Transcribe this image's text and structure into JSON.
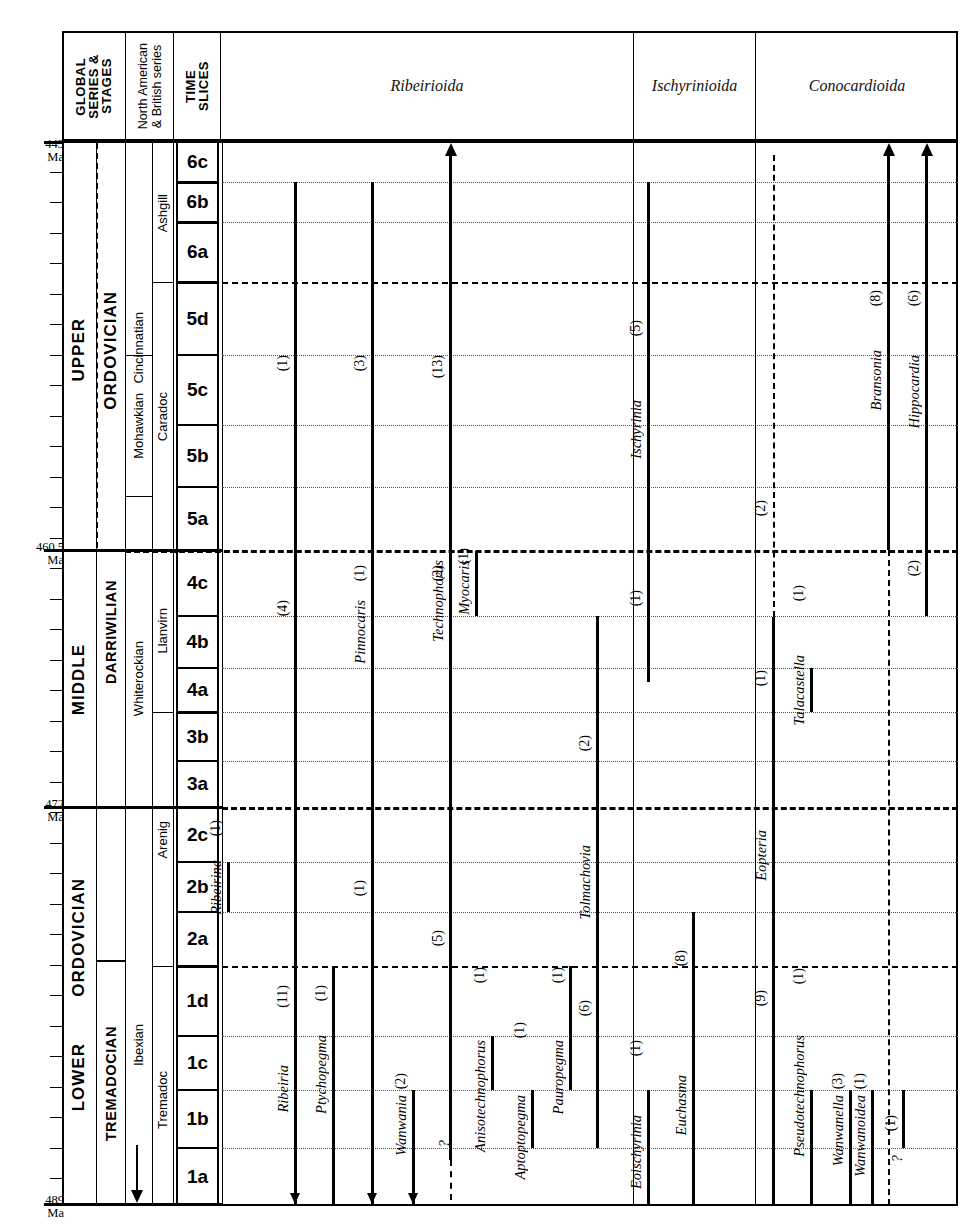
{
  "figure": {
    "type": "range-chart"
  },
  "header": {
    "col_global": "GLOBAL\nSERIES &\nSTAGES",
    "col_global_lines": [
      "GLOBAL",
      "SERIES &",
      "STAGES"
    ],
    "col_namerican": "North American\n& British series",
    "col_namerican_lines": [
      "North American",
      "& British series"
    ],
    "col_timeslices": "TIME\nSLICES",
    "col_timeslices_lines": [
      "TIME",
      "SLICES"
    ],
    "superfamilies": [
      {
        "label": "Ribeirioida"
      },
      {
        "label": "Ischyrinioida"
      },
      {
        "label": "Conocardioida"
      }
    ]
  },
  "age_labels": [
    {
      "value": "443",
      "unit": "Ma"
    },
    {
      "value": "460.5",
      "unit": "Ma"
    },
    {
      "value": "472",
      "unit": "Ma"
    },
    {
      "value": "489",
      "unit": "Ma"
    }
  ],
  "global_series": [
    {
      "label": "UPPER"
    },
    {
      "label": "MIDDLE"
    },
    {
      "label": "LOWER"
    }
  ],
  "global_stages": [
    {
      "label": "ORDOVICIAN"
    },
    {
      "label": "ORDOVICIAN"
    },
    {
      "label": "ORDOVICIAN"
    },
    {
      "label": "DARRIWILIAN"
    },
    {
      "label": "TREMADOCIAN"
    }
  ],
  "north_american_series": [
    {
      "label": "Cincinnatian"
    },
    {
      "label": "Mohawkian"
    },
    {
      "label": "Whiterockian"
    },
    {
      "label": "Ibexian"
    }
  ],
  "british_series": [
    {
      "label": "Ashgill"
    },
    {
      "label": "Caradoc"
    },
    {
      "label": "Llanvirn"
    },
    {
      "label": "Arenig"
    },
    {
      "label": "Tremadoc"
    }
  ],
  "time_slices": [
    {
      "label": "6c"
    },
    {
      "label": "6b"
    },
    {
      "label": "6a"
    },
    {
      "label": "5d"
    },
    {
      "label": "5c"
    },
    {
      "label": "5b"
    },
    {
      "label": "5a"
    },
    {
      "label": "4c"
    },
    {
      "label": "4b"
    },
    {
      "label": "4a"
    },
    {
      "label": "3b"
    },
    {
      "label": "3a"
    },
    {
      "label": "2c"
    },
    {
      "label": "2b"
    },
    {
      "label": "2a"
    },
    {
      "label": "1d"
    },
    {
      "label": "1c"
    },
    {
      "label": "1b"
    },
    {
      "label": "1a"
    }
  ],
  "taxa": [
    {
      "name": "Ribeirina",
      "count": "(1)",
      "superfamily": "Ribeirioida"
    },
    {
      "name": "Ribeiria",
      "count_upper": "(1)",
      "count_lower": "(4)",
      "count_base": "(11)",
      "superfamily": "Ribeirioida"
    },
    {
      "name": "Ptychopegma",
      "count": "(1)",
      "superfamily": "Ribeirioida"
    },
    {
      "name": "Pinnocaris",
      "count_upper": "(3)",
      "count_mid": "(1)",
      "count_lower": "(1)",
      "superfamily": "Ribeirioida"
    },
    {
      "name": "Wanwania",
      "count": "(2)",
      "superfamily": "Ribeirioida"
    },
    {
      "name": "Technophorus",
      "count_upper": "(13)",
      "count_mid": "(2)",
      "count_lower": "(5)",
      "superfamily": "Ribeirioida"
    },
    {
      "name": "Myocaris",
      "count": "(1)",
      "superfamily": "Ribeirioida"
    },
    {
      "name": "Anisotechnophorus",
      "count": "(1)",
      "superfamily": "Ribeirioida"
    },
    {
      "name": "Aptoptopegma",
      "count": "(1)",
      "superfamily": "Ribeirioida"
    },
    {
      "name": "Pauropegma",
      "count": "(1)",
      "superfamily": "Ribeirioida"
    },
    {
      "name": "Tolmachovia",
      "count_upper": "(2)",
      "count_lower": "(6)",
      "superfamily": "Ribeirioida"
    },
    {
      "name": "Eoischyrinia",
      "count": "(1)",
      "superfamily": "Ischyrinioida"
    },
    {
      "name": "Ischyrinia",
      "count_upper": "(5)",
      "count_lower": "(1)",
      "superfamily": "Ischyrinioida"
    },
    {
      "name": "Euchasma",
      "count": "(8)",
      "superfamily": "Ischyrinioida"
    },
    {
      "name": "Eopteria",
      "count_upper": "(2)",
      "count_mid": "(1)",
      "count_lower": "(9)",
      "superfamily": "Conocardioida"
    },
    {
      "name": "Talacastella",
      "count": "(1)",
      "superfamily": "Conocardioida"
    },
    {
      "name": "Pseudotechnophorus",
      "count": "(1)",
      "superfamily": "Conocardioida"
    },
    {
      "name": "Wanwanella",
      "count": "(3)",
      "superfamily": "Conocardioida"
    },
    {
      "name": "Wanwanoidea",
      "count": "(1)",
      "superfamily": "Conocardioida"
    },
    {
      "name": "Bransonia",
      "count": "(8)",
      "superfamily": "Conocardioida"
    },
    {
      "name": "Hippocardia",
      "count_upper": "(6)",
      "count_lower": "(2)",
      "superfamily": "Conocardioida"
    },
    {
      "name": "unnamed-queried",
      "count": "(1)",
      "query": "?",
      "superfamily": "Conocardioida"
    }
  ],
  "chart_data": {
    "type": "range-chart",
    "ylabel": "Time (Ma)",
    "ylim": [
      489,
      443
    ],
    "y_axis_direction": "older-at-bottom",
    "grid": "dotted time-slice lines; dashed series boundaries",
    "legend": "none",
    "time_slice_scale": [
      {
        "slice": "6c",
        "top_ma": 443.0,
        "base_ma": 445.2
      },
      {
        "slice": "6b",
        "top_ma": 445.2,
        "base_ma": 447.4
      },
      {
        "slice": "6a",
        "top_ma": 447.4,
        "base_ma": 450.6
      },
      {
        "slice": "5d",
        "top_ma": 450.6,
        "base_ma": 454.5
      },
      {
        "slice": "5c",
        "top_ma": 454.5,
        "base_ma": 458.3
      },
      {
        "slice": "5b",
        "top_ma": 458.3,
        "base_ma": 461.6
      },
      {
        "slice": "5a",
        "top_ma": 461.6,
        "base_ma": 460.5
      },
      {
        "slice": "4c",
        "top_ma": 460.5,
        "base_ma": 463.0
      },
      {
        "slice": "4b",
        "top_ma": 463.0,
        "base_ma": 465.1
      },
      {
        "slice": "4a",
        "top_ma": 465.1,
        "base_ma": 467.0
      },
      {
        "slice": "3b",
        "top_ma": 467.0,
        "base_ma": 469.2
      },
      {
        "slice": "3a",
        "top_ma": 469.2,
        "base_ma": 472.0
      },
      {
        "slice": "2c",
        "top_ma": 472.0,
        "base_ma": 474.4
      },
      {
        "slice": "2b",
        "top_ma": 474.4,
        "base_ma": 476.6
      },
      {
        "slice": "2a",
        "top_ma": 476.6,
        "base_ma": 479.0
      },
      {
        "slice": "1d",
        "top_ma": 479.0,
        "base_ma": 482.1
      },
      {
        "slice": "1c",
        "top_ma": 482.1,
        "base_ma": 484.5
      },
      {
        "slice": "1b",
        "top_ma": 484.5,
        "base_ma": 487.0
      },
      {
        "slice": "1a",
        "top_ma": 487.0,
        "base_ma": 489.0
      }
    ],
    "ranges": [
      {
        "taxon": "Ribeirina",
        "from_slice": "2b",
        "to_slice": "2b",
        "species": 1,
        "top_open": false,
        "base_open": false
      },
      {
        "taxon": "Ribeiria",
        "from_slice": "1a",
        "to_slice": "6b",
        "species": 11,
        "top_open": false,
        "base_open": true,
        "extra_counts": [
          1,
          4
        ]
      },
      {
        "taxon": "Ptychopegma",
        "from_slice": "1a",
        "to_slice": "1d",
        "species": 1,
        "top_open": false,
        "base_open": false
      },
      {
        "taxon": "Pinnocaris",
        "from_slice": "1a",
        "to_slice": "6b",
        "species": 3,
        "top_open": false,
        "base_open": true,
        "extra_counts": [
          1,
          1
        ]
      },
      {
        "taxon": "Wanwania",
        "from_slice": "1a",
        "to_slice": "1b",
        "species": 2,
        "top_open": false,
        "base_open": true
      },
      {
        "taxon": "Technophorus",
        "from_slice": "1a",
        "to_slice": "6c",
        "species": 13,
        "top_open": true,
        "base_open": true,
        "base_query": true,
        "extra_counts": [
          2,
          5
        ]
      },
      {
        "taxon": "Myocaris",
        "from_slice": "4c",
        "to_slice": "4c",
        "species": 1,
        "top_open": false,
        "base_open": false
      },
      {
        "taxon": "Anisotechnophorus",
        "from_slice": "1c",
        "to_slice": "1c",
        "species": 1,
        "top_open": false,
        "base_open": false
      },
      {
        "taxon": "Aptoptopegma",
        "from_slice": "1b",
        "to_slice": "1b",
        "species": 1,
        "top_open": false,
        "base_open": false
      },
      {
        "taxon": "Pauropegma",
        "from_slice": "1c",
        "to_slice": "1d",
        "species": 1,
        "top_open": false,
        "base_open": false
      },
      {
        "taxon": "Tolmachovia",
        "from_slice": "1a",
        "to_slice": "4b",
        "species": 6,
        "top_open": false,
        "base_open": false,
        "extra_counts": [
          2
        ]
      },
      {
        "taxon": "Eoischyrinia",
        "from_slice": "1a",
        "to_slice": "1c",
        "species": 1,
        "top_open": false,
        "base_open": false
      },
      {
        "taxon": "Ischyrinia",
        "from_slice": "4a",
        "to_slice": "6b",
        "species": 5,
        "top_open": false,
        "base_open": false,
        "extra_counts": [
          1
        ]
      },
      {
        "taxon": "Euchasma",
        "from_slice": "1a",
        "to_slice": "2b",
        "species": 8,
        "top_open": false,
        "base_open": false
      },
      {
        "taxon": "Eopteria",
        "from_slice": "1a",
        "to_slice": "6c",
        "species": 9,
        "top_open": false,
        "base_open": false,
        "dashed_upper": true,
        "extra_counts": [
          2,
          1
        ]
      },
      {
        "taxon": "Talacastella",
        "from_slice": "4a",
        "to_slice": "4a",
        "species": 1,
        "top_open": false,
        "base_open": false
      },
      {
        "taxon": "Pseudotechnophorus",
        "from_slice": "1a",
        "to_slice": "1b",
        "species": 1,
        "top_open": false,
        "base_open": false
      },
      {
        "taxon": "Wanwanella",
        "from_slice": "1a",
        "to_slice": "1b",
        "species": 3,
        "top_open": false,
        "base_open": false
      },
      {
        "taxon": "Wanwanoidea",
        "from_slice": "1a",
        "to_slice": "1b",
        "species": 1,
        "top_open": false,
        "base_open": false
      },
      {
        "taxon": "Bransonia",
        "from_slice": "1a",
        "to_slice": "6c",
        "species": 8,
        "top_open": true,
        "base_open": false,
        "dashed_lower": true
      },
      {
        "taxon": "Hippocardia",
        "from_slice": "4b",
        "to_slice": "6c",
        "species": 6,
        "top_open": true,
        "base_open": false,
        "extra_counts": [
          2
        ]
      },
      {
        "taxon": "queried-taxon",
        "from_slice": "1a",
        "to_slice": "1b",
        "species": 1,
        "top_open": false,
        "base_open": false,
        "query": true
      }
    ]
  }
}
